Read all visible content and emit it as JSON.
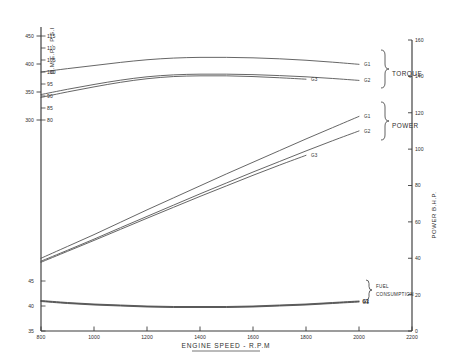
{
  "chart_data": {
    "type": "line",
    "title": "",
    "xlabel": "ENGINE SPEED - R.P.M",
    "xlim": [
      800,
      2200
    ],
    "x_ticks": [
      800,
      1000,
      1200,
      1400,
      1600,
      1800,
      2000,
      2200
    ],
    "grid": false,
    "legend_position": "right-inline",
    "axes": {
      "left_outer": {
        "name": "torque-scale",
        "label": "",
        "ticks": [
          300,
          350,
          400,
          450
        ],
        "lim": [
          300,
          450
        ]
      },
      "left_inner": {
        "name": "bmep-scale",
        "label": "B.M.E.P - P.S.I",
        "ticks": [
          80,
          85,
          90,
          95,
          100,
          105,
          110,
          115
        ],
        "lim": [
          80,
          115
        ]
      },
      "left_lower": {
        "name": "fuel-scale",
        "label": "",
        "ticks": [
          35,
          40,
          45
        ],
        "lim": [
          35,
          45
        ]
      },
      "right": {
        "name": "power-scale",
        "label": "POWER  B.H.P.",
        "ticks": [
          0,
          20,
          40,
          60,
          80,
          100,
          120,
          140,
          160
        ],
        "lim": [
          0,
          160
        ]
      }
    },
    "groups": [
      {
        "name": "TORQUE",
        "series": [
          {
            "name": "G1",
            "x": [
              800,
              900,
              1000,
              1100,
              1200,
              1300,
              1400,
              1500,
              1600,
              1700,
              1800,
              1900,
              2000
            ],
            "values": [
              100.0,
              101.4,
              102.7,
              104.0,
              105.1,
              105.8,
              106.1,
              106.1,
              105.9,
              105.5,
              104.9,
              104.1,
              103.2
            ]
          },
          {
            "name": "G2",
            "x": [
              800,
              900,
              1000,
              1100,
              1200,
              1300,
              1400,
              1500,
              1600,
              1700,
              1800,
              1900,
              2000
            ],
            "values": [
              90.6,
              92.8,
              94.8,
              96.6,
              98.0,
              98.8,
              99.1,
              99.1,
              98.9,
              98.5,
              98.0,
              97.3,
              96.5
            ]
          },
          {
            "name": "G3",
            "x": [
              800,
              900,
              1000,
              1100,
              1200,
              1300,
              1400,
              1500,
              1600,
              1700,
              1800
            ],
            "values": [
              89.4,
              91.7,
              93.8,
              95.7,
              97.2,
              98.1,
              98.4,
              98.4,
              98.1,
              97.6,
              97.0
            ]
          }
        ]
      },
      {
        "name": "POWER",
        "series": [
          {
            "name": "G1",
            "x": [
              800,
              900,
              1000,
              1100,
              1200,
              1300,
              1400,
              1500,
              1600,
              1700,
              1800,
              1900,
              2000
            ],
            "values": [
              40.0,
              46.5,
              53.0,
              59.8,
              66.6,
              73.2,
              79.8,
              86.4,
              92.8,
              99.2,
              105.6,
              111.8,
              118.0
            ]
          },
          {
            "name": "G2",
            "x": [
              800,
              900,
              1000,
              1100,
              1200,
              1300,
              1400,
              1500,
              1600,
              1700,
              1800,
              1900,
              2000
            ],
            "values": [
              38.4,
              44.4,
              50.5,
              56.8,
              63.0,
              69.2,
              75.4,
              81.4,
              87.4,
              93.2,
              99.0,
              104.6,
              110.0
            ]
          },
          {
            "name": "G3",
            "x": [
              800,
              900,
              1000,
              1100,
              1200,
              1300,
              1400,
              1500,
              1600,
              1700,
              1800
            ],
            "values": [
              37.8,
              43.8,
              49.8,
              55.9,
              62.0,
              68.0,
              74.0,
              79.8,
              85.6,
              91.2,
              96.6
            ]
          }
        ]
      },
      {
        "name": "FUEL CONSUMPTION",
        "series": [
          {
            "name": "G1",
            "x": [
              800,
              900,
              1000,
              1100,
              1200,
              1300,
              1400,
              1500,
              1600,
              1700,
              1800,
              1900,
              2000
            ],
            "values": [
              41.1,
              40.7,
              40.4,
              40.2,
              40.0,
              39.9,
              39.9,
              39.9,
              40.0,
              40.2,
              40.4,
              40.7,
              41.0
            ]
          },
          {
            "name": "G2",
            "x": [
              800,
              900,
              1000,
              1100,
              1200,
              1300,
              1400,
              1500,
              1600,
              1700,
              1800,
              1900,
              2000
            ],
            "values": [
              41.0,
              40.6,
              40.3,
              40.1,
              39.9,
              39.8,
              39.8,
              39.8,
              39.9,
              40.1,
              40.3,
              40.6,
              40.9
            ]
          },
          {
            "name": "G3",
            "x": [
              800,
              900,
              1000,
              1100,
              1200,
              1300,
              1400,
              1500,
              1600,
              1700,
              1800,
              1900,
              2000
            ],
            "values": [
              40.9,
              40.5,
              40.2,
              40.0,
              39.8,
              39.7,
              39.7,
              39.7,
              39.8,
              40.0,
              40.2,
              40.5,
              40.8
            ]
          }
        ]
      }
    ]
  },
  "labels": {
    "x_axis_title": "ENGINE SPEED - R.P.M",
    "y_left_title": "B.M.E.P - P.S.I",
    "y_right_title": "POWER  B.H.P.",
    "group_torque": "TORQUE",
    "group_power": "POWER",
    "group_fuel_line1": "FUEL",
    "group_fuel_line2": "CONSUMPTION",
    "series_g1": "G1",
    "series_g2": "G2",
    "series_g3": "G3",
    "torque_ticks": [
      "450",
      "400",
      "350",
      "300"
    ],
    "bmep_ticks": [
      "115",
      "110",
      "105",
      "100",
      "95",
      "90",
      "85",
      "80"
    ],
    "fuel_ticks": [
      "45",
      "40",
      "35"
    ],
    "x_ticks": [
      "800",
      "1000",
      "1200",
      "1400",
      "1600",
      "1800",
      "2000",
      "2200"
    ],
    "power_ticks": [
      "160",
      "140",
      "120",
      "100",
      "80",
      "60",
      "40",
      "20",
      "0"
    ]
  },
  "colors": {
    "axis": "#3a3a3a",
    "curve": "#4a4a4a",
    "text": "#2e2e2e",
    "background": "#ffffff"
  }
}
